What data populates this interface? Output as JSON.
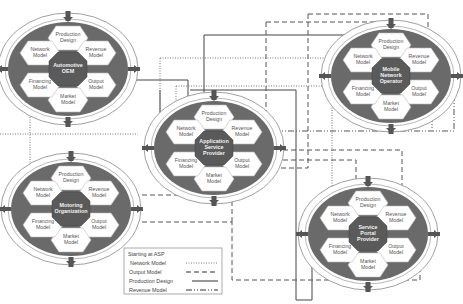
{
  "diagram": {
    "nodes": [
      {
        "id": "oem",
        "center_label": [
          "Automotive",
          "OEM"
        ],
        "segments": {
          "top": [
            "Production",
            "Design"
          ],
          "top_right": [
            "Revenue",
            "Model"
          ],
          "bottom_right": [
            "Output",
            "Model"
          ],
          "bottom": [
            "Market",
            "Model"
          ],
          "bottom_left": [
            "Financing",
            "Model"
          ],
          "top_left": [
            "Network",
            "Model"
          ]
        }
      },
      {
        "id": "asp",
        "center_label": [
          "Application",
          "Service",
          "Provider"
        ],
        "segments": {
          "top": [
            "Production",
            "Design"
          ],
          "top_right": [
            "Revenue",
            "Model"
          ],
          "bottom_right": [
            "Output",
            "Model"
          ],
          "bottom": [
            "Market",
            "Model"
          ],
          "bottom_left": [
            "Financing",
            "Model"
          ],
          "top_left": [
            "Network",
            "Model"
          ]
        }
      },
      {
        "id": "mno",
        "center_label": [
          "Mobile",
          "Network",
          "Operator"
        ],
        "segments": {
          "top": [
            "Production",
            "Design"
          ],
          "top_right": [
            "Revenue",
            "Model"
          ],
          "bottom_right": [
            "Output",
            "Model"
          ],
          "bottom": [
            "Market",
            "Model"
          ],
          "bottom_left": [
            "Financing",
            "Model"
          ],
          "top_left": [
            "Network",
            "Model"
          ]
        }
      },
      {
        "id": "motoring",
        "center_label": [
          "Motoring",
          "Organization"
        ],
        "segments": {
          "top": [
            "Production",
            "Design"
          ],
          "top_right": [
            "Revenue",
            "Model"
          ],
          "bottom_right": [
            "Output",
            "Model"
          ],
          "bottom": [
            "Market",
            "Model"
          ],
          "bottom_left": [
            "Financing",
            "Model"
          ],
          "top_left": [
            "Network",
            "Model"
          ]
        }
      },
      {
        "id": "spp",
        "center_label": [
          "Service",
          "Portal",
          "Provider"
        ],
        "segments": {
          "top": [
            "Production",
            "Design"
          ],
          "top_right": [
            "Revenue",
            "Model"
          ],
          "bottom_right": [
            "Output",
            "Model"
          ],
          "bottom": [
            "Market",
            "Model"
          ],
          "bottom_left": [
            "Financing",
            "Model"
          ],
          "top_left": [
            "Network",
            "Model"
          ]
        }
      }
    ],
    "legend": {
      "title": "Starting at ASP",
      "items": [
        {
          "label": "Network Model",
          "style": "dotted"
        },
        {
          "label": "Output Model",
          "style": "dashed"
        },
        {
          "label": "Production Design",
          "style": "solid"
        },
        {
          "label": "Revenue Model",
          "style": "dash-dot"
        }
      ]
    },
    "colors": {
      "hex_fill": "#ffffff",
      "dark_fill": "#6a6a6a",
      "center_fill": "#5a5a5a",
      "ring_stroke": "#777777",
      "line": "#444444"
    }
  }
}
